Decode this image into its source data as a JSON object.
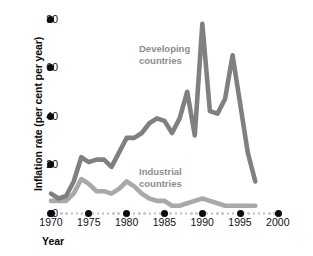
{
  "chart_data": {
    "type": "line",
    "title": "",
    "xlabel": "Year",
    "ylabel": "Inflation rate (per cent per year)",
    "xlim": [
      1970,
      2000
    ],
    "ylim": [
      0,
      80
    ],
    "xticks": [
      1970,
      1975,
      1980,
      1985,
      1990,
      1995,
      2000
    ],
    "yticks": [
      0,
      20,
      40,
      60,
      80
    ],
    "grid": false,
    "legend_position": "inline-annotations",
    "colors": {
      "developing": "#808080",
      "industrial": "#a9a9a9",
      "axis_dot": "#0d0d0d",
      "minor_dot": "#c9c9c9",
      "annotation_text": "#8c8c8c",
      "axis_text": "#111111"
    },
    "series": [
      {
        "name": "Developing countries",
        "color": "#808080",
        "x": [
          1970,
          1971,
          1972,
          1973,
          1974,
          1975,
          1976,
          1977,
          1978,
          1979,
          1980,
          1981,
          1982,
          1983,
          1984,
          1985,
          1986,
          1987,
          1988,
          1989,
          1990,
          1991,
          1992,
          1993,
          1994,
          1995,
          1996,
          1997
        ],
        "values": [
          8,
          6,
          7,
          13,
          23,
          21,
          22,
          22,
          19,
          25,
          31,
          31,
          33,
          37,
          39,
          38,
          33,
          39,
          50,
          32,
          78,
          42,
          41,
          47,
          65,
          45,
          25,
          13
        ]
      },
      {
        "name": "Industrial countries",
        "color": "#a9a9a9",
        "x": [
          1970,
          1971,
          1972,
          1973,
          1974,
          1975,
          1976,
          1977,
          1978,
          1979,
          1980,
          1981,
          1982,
          1983,
          1984,
          1985,
          1986,
          1987,
          1988,
          1989,
          1990,
          1991,
          1992,
          1993,
          1994,
          1995,
          1996,
          1997
        ],
        "values": [
          5,
          5,
          5,
          8,
          14,
          12,
          9,
          9,
          8,
          10,
          13,
          11,
          8,
          6,
          5,
          5,
          3,
          3,
          4,
          5,
          6,
          5,
          4,
          3,
          3,
          3,
          3,
          3
        ]
      }
    ],
    "annotations": [
      {
        "id": "developing",
        "line1": "Developing",
        "line2": "countries"
      },
      {
        "id": "industrial",
        "line1": "Industrial",
        "line2": "countries"
      }
    ]
  },
  "axis": {
    "y_title": "Inflation rate (per cent per year)",
    "x_title": "Year",
    "y_tick_labels": [
      "80",
      "60",
      "40",
      "20",
      "0"
    ],
    "x_tick_labels": [
      "1970",
      "1975",
      "1980",
      "1985",
      "1990",
      "1995",
      "2000"
    ]
  }
}
